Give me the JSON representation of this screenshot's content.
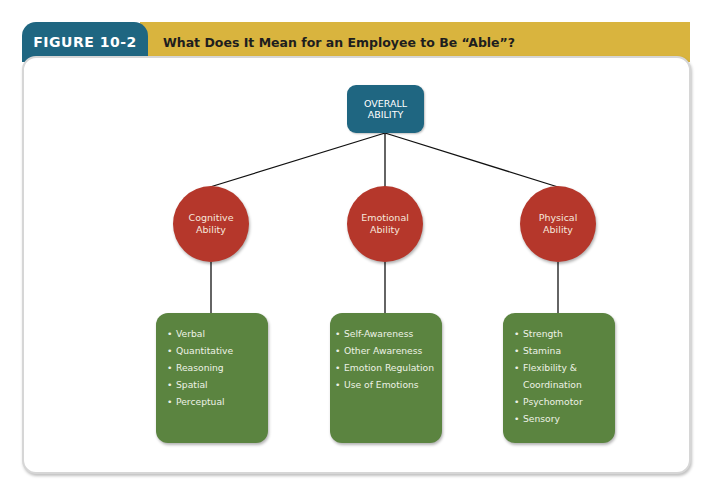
{
  "figure": {
    "label": "FIGURE 10-2",
    "title": "What Does It Mean for an Employee to Be “Able”?",
    "colors": {
      "tab_blue": "#1f6681",
      "header_gold": "#d9b43e",
      "root_node": "#1f6681",
      "ability_circle": "#b5372b",
      "detail_box": "#5b8440"
    }
  },
  "diagram": {
    "root": {
      "line1": "OVERALL",
      "line2": "ABILITY"
    },
    "branches": [
      {
        "line1": "Cognitive",
        "line2": "Ability",
        "items": [
          "Verbal",
          "Quantitative",
          "Reasoning",
          "Spatial",
          "Perceptual"
        ]
      },
      {
        "line1": "Emotional",
        "line2": "Ability",
        "items": [
          "Self-Awareness",
          "Other Awareness",
          "Emotion Regulation",
          "Use of Emotions"
        ]
      },
      {
        "line1": "Physical",
        "line2": "Ability",
        "items": [
          "Strength",
          "Stamina",
          "Flexibility &",
          "Coordination",
          "Psychomotor",
          "Sensory"
        ]
      }
    ],
    "bullet": "•"
  }
}
